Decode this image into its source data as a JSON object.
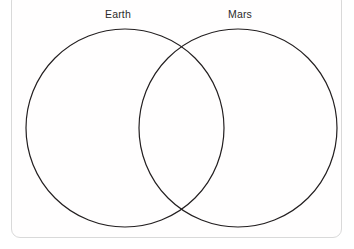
{
  "diagram": {
    "type": "venn",
    "title": "",
    "background_color": "#ffffff",
    "frame": {
      "name": "card-frame",
      "border_color": "#d9d9d9",
      "corner_radius": 9
    },
    "stroke_color": "#231f20",
    "stroke_width": 1.2,
    "fill": "none",
    "sets": [
      {
        "label": "Earth",
        "center_x": 125,
        "center_y": 128,
        "radius": 99,
        "label_x": 118,
        "label_y": 16,
        "contents": []
      },
      {
        "label": "Mars",
        "center_x": 238,
        "center_y": 128,
        "radius": 99,
        "label_x": 240,
        "label_y": 16,
        "contents": []
      }
    ],
    "intersection": {
      "label": "",
      "contents": [],
      "top_point_x": 178,
      "top_point_y": 51,
      "bottom_point_x": 178,
      "bottom_point_y": 207
    }
  }
}
